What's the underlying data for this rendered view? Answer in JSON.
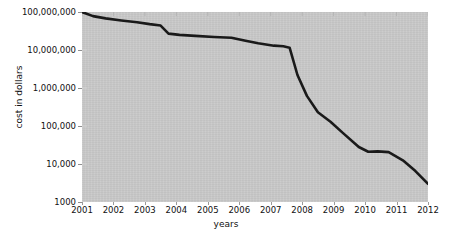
{
  "chart_data": {
    "type": "line",
    "title": "",
    "xlabel": "years",
    "ylabel": "cost in dollars",
    "yscale": "log",
    "ylim": [
      1000,
      100000000
    ],
    "xlim": [
      2001,
      2012
    ],
    "grid": false,
    "legend": false,
    "line_color": "#1a1a1a",
    "plot_background": "#c9c9c9",
    "figure_background": "#ffffff",
    "y_ticks": [
      {
        "value": 100000000,
        "label": "100,000,000"
      },
      {
        "value": 10000000,
        "label": "10,000,000"
      },
      {
        "value": 1000000,
        "label": "1,000,000"
      },
      {
        "value": 100000,
        "label": "100,000"
      },
      {
        "value": 10000,
        "label": "10,000"
      },
      {
        "value": 1000,
        "label": "1000"
      }
    ],
    "x_ticks": [
      {
        "value": 2001,
        "label": "2001"
      },
      {
        "value": 2002,
        "label": "2002"
      },
      {
        "value": 2003,
        "label": "2003"
      },
      {
        "value": 2004,
        "label": "2004"
      },
      {
        "value": 2005,
        "label": "2005"
      },
      {
        "value": 2006,
        "label": "2006"
      },
      {
        "value": 2007,
        "label": "2007"
      },
      {
        "value": 2008,
        "label": "2008"
      },
      {
        "value": 2009,
        "label": "2009"
      },
      {
        "value": 2010,
        "label": "2010"
      },
      {
        "value": 2011,
        "label": "2011"
      },
      {
        "value": 2012,
        "label": "2012"
      }
    ],
    "series": [
      {
        "name": "cost in dollars",
        "x": [
          2001.0,
          2001.35,
          2001.75,
          2002.25,
          2002.75,
          2003.15,
          2003.5,
          2003.75,
          2004.1,
          2004.6,
          2005.2,
          2005.75,
          2006.2,
          2006.6,
          2007.1,
          2007.4,
          2007.6,
          2007.85,
          2008.15,
          2008.5,
          2008.9,
          2009.3,
          2009.8,
          2010.1,
          2010.4,
          2010.75,
          2011.2,
          2011.6,
          2012.0
        ],
        "y": [
          100000000,
          78000000,
          68000000,
          60000000,
          54000000,
          48000000,
          44000000,
          27000000,
          25000000,
          23500000,
          22000000,
          21000000,
          17500000,
          15000000,
          13000000,
          12500000,
          11500000,
          2200000,
          620000,
          230000,
          130000,
          65000,
          28000,
          21000,
          21500,
          20500,
          12500,
          6500,
          3000
        ]
      }
    ]
  }
}
